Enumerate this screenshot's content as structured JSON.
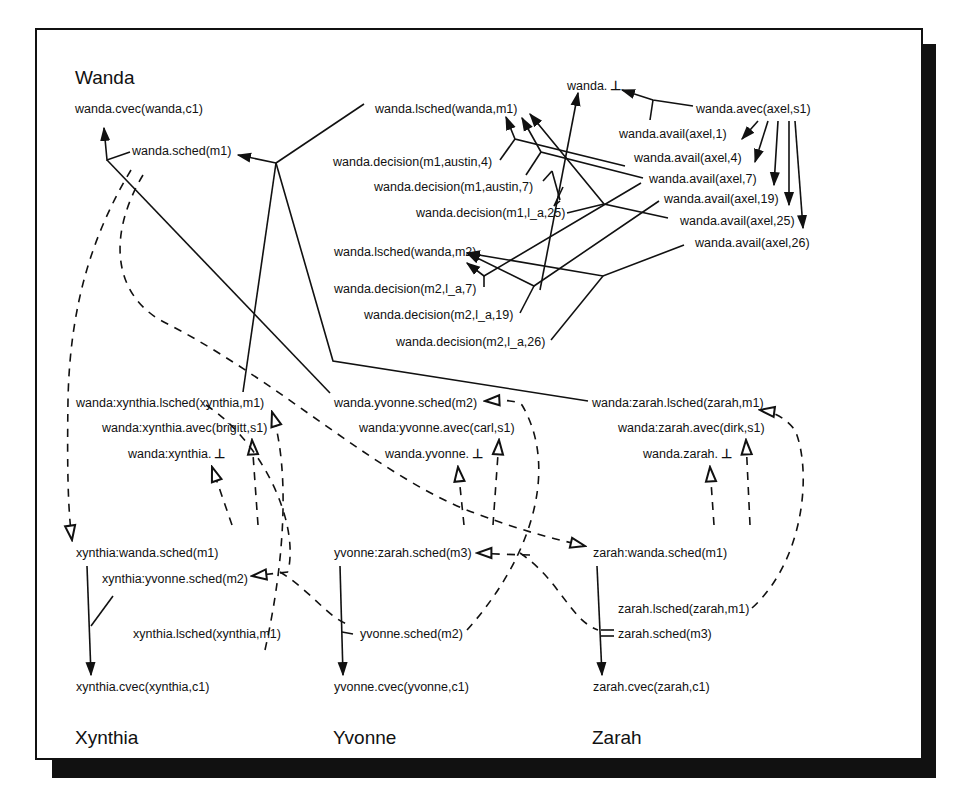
{
  "figure": {
    "type": "distributed-scheduling-causality-diagram",
    "sites": {
      "wanda": "Wanda",
      "xynthia": "Xynthia",
      "yvonne": "Yvonne",
      "zarah": "Zarah"
    },
    "wanda_nodes": {
      "cvec": "wanda.cvec(wanda,c1)",
      "sched_m1": "wanda.sched(m1)",
      "bottom": "wanda.",
      "bottom_symbol": "⊥",
      "avec": "wanda.avec(axel,s1)",
      "lsched_m1": "wanda.lsched(wanda,m1)",
      "lsched_m2": "wanda.lsched(wanda,m2)",
      "avail_1": "wanda.avail(axel,1)",
      "avail_4": "wanda.avail(axel,4)",
      "avail_7": "wanda.avail(axel,7)",
      "avail_19": "wanda.avail(axel,19)",
      "avail_25": "wanda.avail(axel,25)",
      "avail_26": "wanda.avail(axel,26)",
      "decision_m1_austin_4": "wanda.decision(m1,austin,4)",
      "decision_m1_austin_7": "wanda.decision(m1,austin,7)",
      "decision_m1_la_25": "wanda.decision(m1,l_a,25)",
      "decision_m2_la_7": "wanda.decision(m2,l_a,7)",
      "decision_m2_la_19": "wanda.decision(m2,l_a,19)",
      "decision_m2_la_26": "wanda.decision(m2,l_a,26)"
    },
    "wanda_proxy_nodes": {
      "xynthia_lsched": "wanda:xynthia.lsched(xynthia,m1)",
      "xynthia_avec": "wanda:xynthia.avec(brigitt,s1)",
      "xynthia_bottom": "wanda:xynthia.",
      "yvonne_sched": "wanda.yvonne.sched(m2)",
      "yvonne_avec": "wanda:yvonne.avec(carl,s1)",
      "yvonne_bottom": "wanda.yvonne.",
      "zarah_lsched": "wanda:zarah.lsched(zarah,m1)",
      "zarah_avec": "wanda:zarah.avec(dirk,s1)",
      "zarah_bottom": "wanda.zarah."
    },
    "xynthia_nodes": {
      "wanda_sched": "xynthia:wanda.sched(m1)",
      "yvonne_sched": "xynthia:yvonne.sched(m2)",
      "lsched": "xynthia.lsched(xynthia,m1)",
      "cvec": "xynthia.cvec(xynthia,c1)"
    },
    "yvonne_nodes": {
      "zarah_sched": "yvonne:zarah.sched(m3)",
      "sched": "yvonne.sched(m2)",
      "cvec": "yvonne.cvec(yvonne,c1)"
    },
    "zarah_nodes": {
      "wanda_sched": "zarah:wanda.sched(m1)",
      "lsched": "zarah.lsched(zarah,m1)",
      "sched": "zarah.sched(m3)",
      "cvec": "zarah.cvec(zarah,c1)"
    },
    "legend": {
      "solid_arrow": "local causal dependency",
      "dashed_hollow_arrow": "message / remote dependency"
    }
  }
}
